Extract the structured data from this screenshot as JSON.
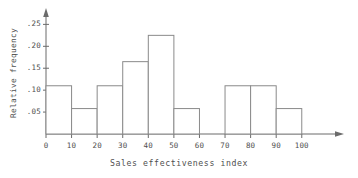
{
  "chart_data": {
    "type": "bar",
    "title": "",
    "xlabel": "Sales effectiveness index",
    "ylabel": "Relative frequency",
    "xlim": [
      0,
      104
    ],
    "ylim": [
      0,
      0.26
    ],
    "grid": false,
    "legend": null,
    "bin_edges": [
      0,
      10,
      20,
      30,
      40,
      50,
      60,
      70,
      80,
      90,
      100
    ],
    "categories": [
      "0-10",
      "10-20",
      "20-30",
      "30-40",
      "40-50",
      "50-60",
      "60-70",
      "70-80",
      "80-90",
      "90-100"
    ],
    "values": [
      0.11,
      0.058,
      0.11,
      0.165,
      0.225,
      0.058,
      0.0,
      0.11,
      0.11,
      0.058
    ],
    "xticks": [
      0,
      10,
      20,
      30,
      40,
      50,
      60,
      70,
      80,
      90,
      100
    ],
    "xtick_labels": [
      "0",
      "10",
      "20",
      "30",
      "40",
      "50",
      "60",
      "70",
      "80",
      "90",
      "100"
    ],
    "yticks": [
      0.05,
      0.1,
      0.15,
      0.2,
      0.25
    ],
    "ytick_labels": [
      ".05",
      ".10",
      ".15",
      ".20",
      ".25"
    ],
    "bar_fill": "#ffffff",
    "bar_edge_color": "#8a8a8a",
    "axis_color": "#6b6b6b",
    "text_color": "#4f4f4f",
    "background": "#ffffff"
  }
}
